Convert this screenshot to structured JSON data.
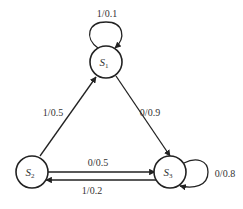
{
  "diagram": {
    "type": "state-transition",
    "states": [
      {
        "id": "S1",
        "label": "S",
        "subscript": "1"
      },
      {
        "id": "S2",
        "label": "S",
        "subscript": "2"
      },
      {
        "id": "S3",
        "label": "S",
        "subscript": "3"
      }
    ],
    "transitions": [
      {
        "from": "S1",
        "to": "S1",
        "label": "1/0.1"
      },
      {
        "from": "S2",
        "to": "S1",
        "label": "1/0.5"
      },
      {
        "from": "S1",
        "to": "S3",
        "label": "0/0.9"
      },
      {
        "from": "S2",
        "to": "S3",
        "label": "0/0.5"
      },
      {
        "from": "S3",
        "to": "S2",
        "label": "1/0.2"
      },
      {
        "from": "S3",
        "to": "S3",
        "label": "0/0.8"
      }
    ]
  }
}
